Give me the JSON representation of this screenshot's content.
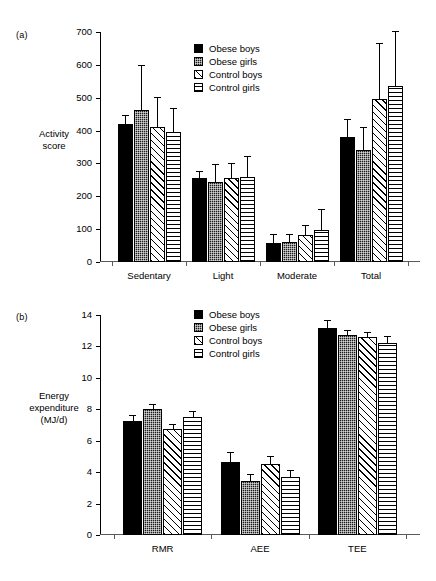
{
  "figure": {
    "panel_a_tag": "(a)",
    "panel_b_tag": "(b)"
  },
  "legend": {
    "entries": [
      {
        "label": "Obese boys",
        "pattern": "solid-black"
      },
      {
        "label": "Obese girls",
        "pattern": "dense-dots"
      },
      {
        "label": "Control boys",
        "pattern": "diagonal-hatch"
      },
      {
        "label": "Control girls",
        "pattern": "horizontal-lines"
      }
    ]
  },
  "chart_data": [
    {
      "type": "bar",
      "panel": "(a)",
      "title": "",
      "xlabel": "",
      "ylabel": "Activity score",
      "ylabel_lines": [
        "Activity",
        "score"
      ],
      "ylim": [
        0,
        700
      ],
      "yticks": [
        0,
        100,
        200,
        300,
        400,
        500,
        600,
        700
      ],
      "ytick_labels": [
        "0",
        "100",
        "200",
        "300",
        "400",
        "500",
        "600",
        "700"
      ],
      "grid": false,
      "legend_position": "upper-center",
      "categories": [
        "Sedentary",
        "Light",
        "Moderate",
        "Total"
      ],
      "series": [
        {
          "name": "Obese boys",
          "values": [
            420,
            255,
            58,
            380
          ],
          "errors": [
            24,
            20,
            25,
            53
          ]
        },
        {
          "name": "Obese girls",
          "values": [
            463,
            243,
            60,
            341
          ],
          "errors": [
            134,
            53,
            22,
            67
          ]
        },
        {
          "name": "Control boys",
          "values": [
            411,
            255,
            82,
            497
          ],
          "errors": [
            88,
            42,
            27,
            166
          ]
        },
        {
          "name": "Control girls",
          "values": [
            396,
            259,
            97,
            535
          ],
          "errors": [
            71,
            60,
            61,
            164
          ]
        }
      ]
    },
    {
      "type": "bar",
      "panel": "(b)",
      "title": "",
      "xlabel": "",
      "ylabel": "Energy expenditure (MJ/d)",
      "ylabel_lines": [
        "Energy",
        "expenditure",
        "(MJ/d)"
      ],
      "ylim": [
        0,
        14
      ],
      "yticks": [
        0,
        2,
        4,
        6,
        8,
        10,
        12,
        14
      ],
      "ytick_labels": [
        "0",
        "2",
        "4",
        "6",
        "8",
        "10",
        "12",
        "14"
      ],
      "grid": false,
      "legend_position": "upper-center",
      "categories": [
        "RMR",
        "AEE",
        "TEE"
      ],
      "series": [
        {
          "name": "Obese boys",
          "values": [
            7.25,
            4.65,
            13.15
          ],
          "errors": [
            0.35,
            0.55,
            0.45
          ]
        },
        {
          "name": "Obese girls",
          "values": [
            8.05,
            3.45,
            12.7
          ],
          "errors": [
            0.25,
            0.35,
            0.28
          ]
        },
        {
          "name": "Control boys",
          "values": [
            6.75,
            4.55,
            12.6
          ],
          "errors": [
            0.22,
            0.4,
            0.28
          ]
        },
        {
          "name": "Control girls",
          "values": [
            7.5,
            3.7,
            12.25
          ],
          "errors": [
            0.35,
            0.4,
            0.33
          ]
        }
      ]
    }
  ]
}
